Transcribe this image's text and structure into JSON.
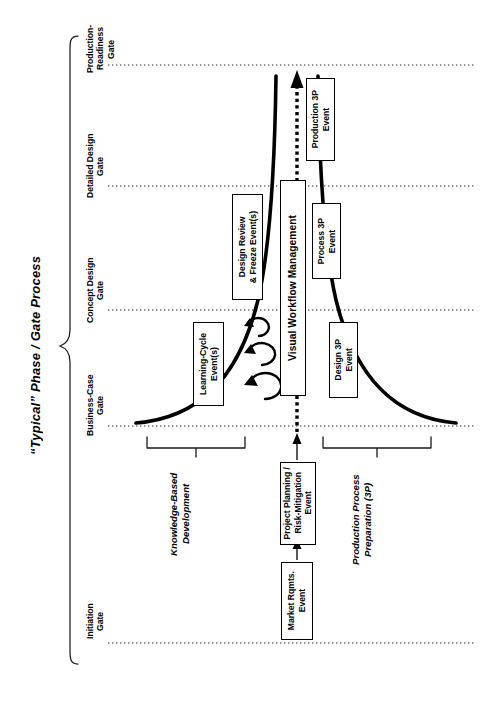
{
  "diagram": {
    "title": "“Typical” Phase / Gate Process",
    "type": "process-phase-gate-diagram",
    "gates": [
      {
        "id": "production-readiness",
        "label": "Production-\nReadiness\nGate"
      },
      {
        "id": "detailed-design",
        "label": "Detailed Design\nGate"
      },
      {
        "id": "concept-design",
        "label": "Concept Design\nGate"
      },
      {
        "id": "business-case",
        "label": "Business-Case\nGate"
      },
      {
        "id": "initiation",
        "label": "Initiation\nGate"
      }
    ],
    "event_boxes": [
      {
        "id": "production-3p",
        "label": "Production 3P\nEvent"
      },
      {
        "id": "process-3p",
        "label": "Process 3P\nEvent"
      },
      {
        "id": "design-3p",
        "label": "Design 3P\nEvent"
      },
      {
        "id": "design-review-freeze",
        "label": "Design Review\n& Freeze Event(s)"
      },
      {
        "id": "learning-cycle",
        "label": "Learning-Cycle\nEvent(s)"
      },
      {
        "id": "visual-workflow",
        "label": "Visual Workflow Management"
      },
      {
        "id": "project-planning",
        "label": "Project Planning /\nRisk-Mitigation\nEvent"
      },
      {
        "id": "market-rqmts",
        "label": "Market Rqmts.\nEvent"
      }
    ],
    "phase_brackets": [
      {
        "id": "knowledge-based-development",
        "label": "Knowledge-Based\nDevelopment"
      },
      {
        "id": "production-process-preparation",
        "label": "Production Process\nPreparation (3P)"
      }
    ],
    "colors": {
      "ink": "#000000",
      "background": "#ffffff",
      "gate_line": "#333333",
      "funnel_curve": "#000000"
    },
    "loop_arrows_count": 3
  }
}
